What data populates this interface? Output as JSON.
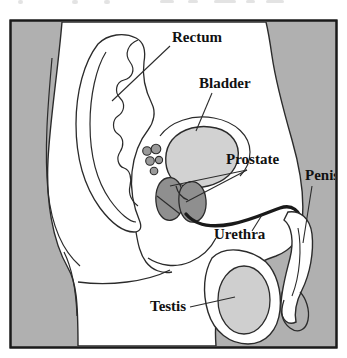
{
  "figure": {
    "frame": {
      "border_color": "#1a1a1a",
      "background_color": "#b0b0b0",
      "body_fill": "#ffffff"
    },
    "colors": {
      "outline": "#2b2b2b",
      "background_gray": "#b0b0b0",
      "bladder_fill": "#d2d2d2",
      "prostate_fill": "#8f8f8f",
      "testis_fill": "#cfcfcf",
      "vesicle_fill": "#9a9a9a",
      "urethra_stroke": "#1a1a1a",
      "label_color": "#111111",
      "leader_color": "#2b2b2b"
    },
    "labels": [
      {
        "id": "rectum",
        "text": "Rectum",
        "x": 172,
        "y": 42,
        "anchor": "start",
        "leader": {
          "x1": 170,
          "y1": 46,
          "x2": 112,
          "y2": 101
        }
      },
      {
        "id": "bladder",
        "text": "Bladder",
        "x": 199,
        "y": 88,
        "anchor": "start",
        "leader": {
          "x1": 212,
          "y1": 93,
          "x2": 196,
          "y2": 131
        }
      },
      {
        "id": "prostate",
        "text": "Prostate",
        "x": 226,
        "y": 164,
        "anchor": "start",
        "leader": {
          "x1": 247,
          "y1": 170,
          "x2": 170,
          "y2": 186
        },
        "leader2": {
          "x1": 247,
          "y1": 170,
          "x2": 186,
          "y2": 200
        }
      },
      {
        "id": "penis",
        "text": "Penis",
        "x": 305,
        "y": 180,
        "anchor": "start",
        "leader": {
          "x1": 312,
          "y1": 186,
          "x2": 303,
          "y2": 243
        }
      },
      {
        "id": "urethra",
        "text": "Urethra",
        "x": 214,
        "y": 239,
        "anchor": "start",
        "leader": {
          "x1": 252,
          "y1": 231,
          "x2": 262,
          "y2": 215
        }
      },
      {
        "id": "testis",
        "text": "Testis",
        "x": 150,
        "y": 311,
        "anchor": "start",
        "leader": {
          "x1": 190,
          "y1": 307,
          "x2": 235,
          "y2": 297
        }
      }
    ],
    "structures": [
      {
        "id": "bladder",
        "name": "bladder",
        "kind": "organ"
      },
      {
        "id": "prostate-left-lobe",
        "name": "prostate-left-lobe",
        "kind": "organ"
      },
      {
        "id": "prostate-right-lobe",
        "name": "prostate-right-lobe",
        "kind": "organ"
      },
      {
        "id": "testis",
        "name": "testis",
        "kind": "organ"
      },
      {
        "id": "rectum",
        "name": "rectum",
        "kind": "organ"
      },
      {
        "id": "urethra",
        "name": "urethra",
        "kind": "duct"
      },
      {
        "id": "seminal-vesicles",
        "name": "seminal-vesicles",
        "kind": "organ"
      },
      {
        "id": "penis",
        "name": "penis",
        "kind": "organ"
      }
    ]
  }
}
